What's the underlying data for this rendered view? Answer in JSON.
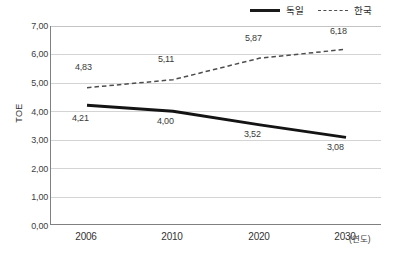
{
  "chart_data": {
    "type": "line",
    "title": "",
    "xlabel": "(연도)",
    "ylabel": "TOE",
    "x": [
      "2006",
      "2010",
      "2020",
      "2030"
    ],
    "categories": [
      "2006",
      "2010",
      "2020",
      "2030"
    ],
    "series": [
      {
        "name": "독일",
        "style": "solid",
        "color": "#1a1a1a",
        "values": [
          4.21,
          4.0,
          3.52,
          3.08
        ],
        "labels": [
          "4,21",
          "4,00",
          "3,52",
          "3,08"
        ]
      },
      {
        "name": "한국",
        "style": "dashed",
        "color": "#4d4d4d",
        "values": [
          4.83,
          5.11,
          5.87,
          6.18
        ],
        "labels": [
          "4,83",
          "5,11",
          "5,87",
          "6,18"
        ]
      }
    ],
    "ylim": [
      0,
      7
    ],
    "ytick_labels": [
      "7,00",
      "6,00",
      "5,00",
      "4,00",
      "3,00",
      "2,00",
      "1,00",
      "0,00"
    ],
    "ytick_values": [
      7,
      6,
      5,
      4,
      3,
      2,
      1,
      0
    ],
    "grid": true,
    "legend_position": "top-right"
  },
  "legend": {
    "germany": "독일",
    "korea": "한국"
  },
  "axes": {
    "y_title": "TOE",
    "x_unit": "(연도)"
  }
}
